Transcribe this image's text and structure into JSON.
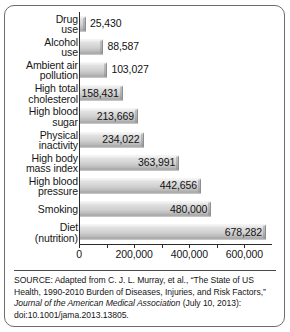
{
  "chart_data": {
    "type": "bar",
    "orientation": "horizontal",
    "title": "",
    "xlabel": "",
    "ylabel": "",
    "xlim": [
      0,
      700000
    ],
    "xticks": [
      0,
      100000,
      200000,
      300000,
      400000,
      500000,
      600000
    ],
    "xtick_labels": [
      "0",
      "",
      "200,000",
      "",
      "400,000",
      "",
      "600,000"
    ],
    "grid": false,
    "legend": null,
    "categories": [
      "Drug\nuse",
      "Alcohol\nuse",
      "Ambient air\npollution",
      "High total\ncholesterol",
      "High blood\nsugar",
      "Physical\ninactivity",
      "High body\nmass index",
      "High blood\npressure",
      "Smoking",
      "Diet\n(nutrition)"
    ],
    "values": [
      25430,
      88587,
      103027,
      158431,
      213669,
      234022,
      363991,
      442656,
      480000,
      678282
    ],
    "value_labels": [
      "25,430",
      "88,587",
      "103,027",
      "158,431",
      "213,669",
      "234,022",
      "363,991",
      "442,656",
      "480,000",
      "678,282"
    ],
    "label_placement": [
      "outside",
      "outside",
      "outside",
      "inside",
      "inside",
      "inside",
      "inside",
      "inside",
      "inside",
      "inside"
    ],
    "bar_color": "#d0d0d0",
    "axis_color": "#2b2b2b"
  },
  "source": {
    "line1": "SOURCE: Adapted from C. J. L. Murray, et al., “The State of US",
    "line2": "Health, 1990-2010 Burden of Diseases, Injuries, and Risk",
    "line3_prefix": "Factors,” ",
    "line3_italic": "Journal of the American Medical Association",
    "line3_suffix": " (July 10,",
    "line4": "2013): doi:10.1001/jama.2013.13805."
  }
}
